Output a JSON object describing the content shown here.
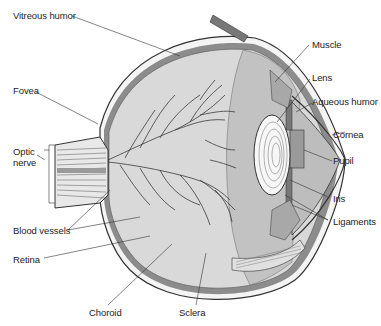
{
  "diagram": {
    "colors": {
      "background": "#ffffff",
      "vitreous": "#d9d9d9",
      "choroid": "#8c8c8c",
      "sclera": "#f4f4f4",
      "lens": "#f7f7f7",
      "aqueous": "#bdbdbd",
      "vessel": "#3a3a3a",
      "leader_line": "#333333",
      "text": "#222222"
    },
    "labels": {
      "vitreous_humor": "Vitreous humor",
      "fovea": "Fovea",
      "optic_nerve_line1": "Optic",
      "optic_nerve_line2": "nerve",
      "blood_vessels": "Blood vessels",
      "retina": "Retina",
      "choroid": "Choroid",
      "sclera": "Sclera",
      "muscle": "Muscle",
      "lens": "Lens",
      "aqueous_humor": "Aqueous humor",
      "cornea": "Cornea",
      "pupil": "Pupil",
      "iris": "Iris",
      "ligaments": "Ligaments"
    }
  }
}
